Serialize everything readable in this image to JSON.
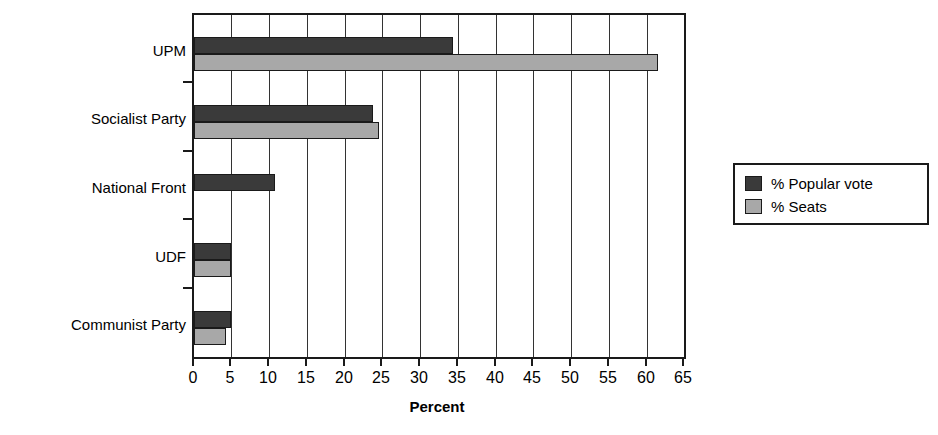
{
  "chart_data": {
    "type": "bar",
    "orientation": "horizontal",
    "title": "",
    "xlabel": "Percent",
    "ylabel": "",
    "xlim": [
      0,
      65
    ],
    "xticks": [
      0,
      5,
      10,
      15,
      20,
      25,
      30,
      35,
      40,
      45,
      50,
      55,
      60,
      65
    ],
    "grid": true,
    "legend_position": "right",
    "categories": [
      "UPM",
      "Socialist Party",
      "National Front",
      "UDF",
      "Communist Party"
    ],
    "series": [
      {
        "name": "% Popular vote",
        "color": "#3a3a3a",
        "values": [
          34.3,
          23.8,
          10.8,
          4.9,
          4.9
        ]
      },
      {
        "name": "% Seats",
        "color": "#a8a8a8",
        "values": [
          61.5,
          24.5,
          0,
          4.9,
          4.3
        ]
      }
    ]
  },
  "legend": {
    "items": [
      {
        "label": "% Popular vote"
      },
      {
        "label": "% Seats"
      }
    ]
  },
  "axis": {
    "x_title": "Percent",
    "tick_labels": [
      "0",
      "5",
      "10",
      "15",
      "20",
      "25",
      "30",
      "35",
      "40",
      "45",
      "50",
      "55",
      "60",
      "65"
    ]
  },
  "colors": {
    "popular_vote": "#3a3a3a",
    "seats": "#a8a8a8",
    "axis": "#1a1a1a",
    "background": "#ffffff"
  }
}
